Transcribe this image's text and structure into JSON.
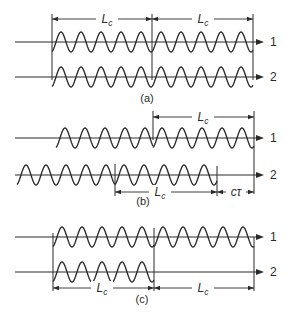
{
  "figure": {
    "wave": {
      "amplitude": 10,
      "period": 20,
      "color": "#2a2a2a"
    },
    "axis_x_start": 15,
    "axis_x_end": 264,
    "axis_label_x": 270,
    "panels": [
      {
        "id": "a",
        "caption": "(a)",
        "caption_pos": [
          147,
          102
        ],
        "axes": [
          {
            "label": "1",
            "y": 42
          },
          {
            "label": "2",
            "y": 77
          }
        ],
        "wave_trains": [
          {
            "axis": 0,
            "x_start": 52,
            "x_end": 152
          },
          {
            "axis": 0,
            "x_start": 152,
            "x_end": 253
          },
          {
            "axis": 1,
            "x_start": 52,
            "x_end": 152
          },
          {
            "axis": 1,
            "x_start": 152,
            "x_end": 253
          }
        ],
        "verticals": [
          {
            "x": 52,
            "y1": 14,
            "y2": 80
          },
          {
            "x": 152,
            "y1": 14,
            "y2": 80
          },
          {
            "x": 253,
            "y1": 14,
            "y2": 80
          }
        ],
        "dimensions": [
          {
            "y": 19,
            "x1": 52,
            "x2": 152,
            "label_x": 107,
            "gap": 22,
            "label": "L",
            "subscript": "c"
          },
          {
            "y": 19,
            "x1": 152,
            "x2": 253,
            "label_x": 203,
            "gap": 22,
            "label": "L",
            "subscript": "c"
          }
        ]
      },
      {
        "id": "b",
        "caption": "(b)",
        "caption_pos": [
          143,
          205
        ],
        "axes": [
          {
            "label": "1",
            "y": 138
          },
          {
            "label": "2",
            "y": 175
          }
        ],
        "wave_trains": [
          {
            "axis": 0,
            "x_start": 56,
            "x_end": 153
          },
          {
            "axis": 0,
            "x_start": 153,
            "x_end": 254
          },
          {
            "axis": 1,
            "x_start": 17,
            "x_end": 115
          },
          {
            "axis": 1,
            "x_start": 115,
            "x_end": 217
          }
        ],
        "verticals": [
          {
            "x": 153,
            "y1": 111,
            "y2": 140
          },
          {
            "x": 254,
            "y1": 111,
            "y2": 194
          },
          {
            "x": 115,
            "y1": 164,
            "y2": 196
          },
          {
            "x": 217,
            "y1": 166,
            "y2": 196
          }
        ],
        "dimensions": [
          {
            "y": 117,
            "x1": 153,
            "x2": 254,
            "label_x": 203,
            "gap": 22,
            "label": "L",
            "subscript": "c"
          },
          {
            "y": 192,
            "x1": 115,
            "x2": 217,
            "label_x": 160,
            "gap": 22,
            "label": "L",
            "subscript": "c"
          },
          {
            "y": 192,
            "x1": 217,
            "x2": 254,
            "label_x": 236,
            "gap": 20,
            "label": "cτ",
            "subscript": ""
          }
        ]
      },
      {
        "id": "c",
        "caption": "(c)",
        "caption_pos": [
          142,
          303
        ],
        "axes": [
          {
            "label": "1",
            "y": 237
          },
          {
            "label": "2",
            "y": 272
          }
        ],
        "wave_trains": [
          {
            "axis": 0,
            "x_start": 53,
            "x_end": 154
          },
          {
            "axis": 0,
            "x_start": 154,
            "x_end": 254
          },
          {
            "axis": 1,
            "x_start": 53,
            "x_end": 154
          }
        ],
        "verticals": [
          {
            "x": 53,
            "y1": 233,
            "y2": 291
          },
          {
            "x": 154,
            "y1": 228,
            "y2": 291
          },
          {
            "x": 254,
            "y1": 237,
            "y2": 291
          }
        ],
        "dimensions": [
          {
            "y": 288,
            "x1": 53,
            "x2": 154,
            "label_x": 102,
            "gap": 22,
            "label": "L",
            "subscript": "c"
          },
          {
            "y": 288,
            "x1": 154,
            "x2": 254,
            "label_x": 203,
            "gap": 22,
            "label": "L",
            "subscript": "c"
          }
        ]
      }
    ]
  }
}
